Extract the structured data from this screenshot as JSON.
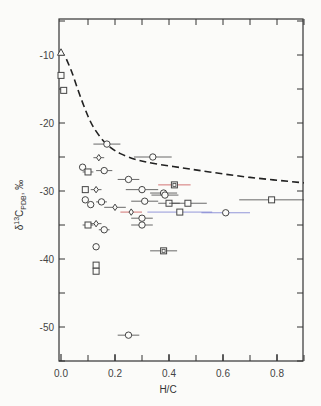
{
  "chart_data": {
    "type": "scatter",
    "title": "",
    "xlabel": "H/C",
    "ylabel": "δ13C PDB, ‰",
    "ylabel_parts": {
      "delta": "δ",
      "sup": "13",
      "main": "C",
      "sub": "PDB",
      "unit": ", ‰"
    },
    "xlim": [
      0.0,
      0.9
    ],
    "ylim": [
      -55,
      -5
    ],
    "xticks": [
      0.0,
      0.2,
      0.4,
      0.6,
      0.8
    ],
    "xtick_labels": [
      "0.0",
      "0.2",
      "0.4",
      "0.6",
      "0.8"
    ],
    "yticks": [
      -10,
      -20,
      -30,
      -40,
      -50
    ],
    "ytick_labels": [
      "-10",
      "-20",
      "-30",
      "-40",
      "-50"
    ],
    "grid": false,
    "legend": null,
    "curve": {
      "name": "dashed trend",
      "style": "dashed",
      "x": [
        0.02,
        0.04,
        0.06,
        0.08,
        0.1,
        0.12,
        0.15,
        0.18,
        0.22,
        0.28,
        0.35,
        0.45,
        0.55,
        0.7,
        0.9
      ],
      "y": [
        -10.6,
        -12.5,
        -14.8,
        -17.0,
        -19.0,
        -20.6,
        -22.3,
        -23.5,
        -24.5,
        -25.4,
        -26.0,
        -26.6,
        -27.2,
        -28.0,
        -28.8
      ]
    },
    "series": [
      {
        "name": "circles",
        "marker": "circle",
        "points": [
          {
            "x": 0.17,
            "y": -23.1,
            "xerr": 0.05
          },
          {
            "x": 0.34,
            "y": -25.0,
            "xerr": 0.07
          },
          {
            "x": 0.08,
            "y": -26.5,
            "xerr": 0.0
          },
          {
            "x": 0.16,
            "y": -27.0,
            "xerr": 0.03
          },
          {
            "x": 0.3,
            "y": -29.8,
            "xerr": 0.06
          },
          {
            "x": 0.38,
            "y": -30.3,
            "xerr": 0.05
          },
          {
            "x": 0.385,
            "y": -30.6,
            "xerr": 0.05
          },
          {
            "x": 0.09,
            "y": -31.3,
            "xerr": 0.0
          },
          {
            "x": 0.11,
            "y": -32.0,
            "xerr": 0.0
          },
          {
            "x": 0.15,
            "y": -31.6,
            "xerr": 0.02
          },
          {
            "x": 0.31,
            "y": -31.5,
            "xerr": 0.05
          },
          {
            "x": 0.61,
            "y": -33.2,
            "xerr": 0.09,
            "color": "#7a7fd0"
          },
          {
            "x": 0.16,
            "y": -35.7,
            "xerr": 0.02
          },
          {
            "x": 0.3,
            "y": -34.0,
            "xerr": 0.04
          },
          {
            "x": 0.3,
            "y": -35.0,
            "xerr": 0.04
          },
          {
            "x": 0.13,
            "y": -38.2,
            "xerr": 0.01
          },
          {
            "x": 0.25,
            "y": -51.2,
            "xerr": 0.04
          },
          {
            "x": 0.25,
            "y": -28.3,
            "xerr": 0.04
          }
        ]
      },
      {
        "name": "squares",
        "marker": "square",
        "points": [
          {
            "x": 0.0,
            "y": -13.0,
            "xerr": 0.0
          },
          {
            "x": 0.01,
            "y": -15.2,
            "xerr": 0.0
          },
          {
            "x": 0.1,
            "y": -27.2,
            "xerr": 0.02
          },
          {
            "x": 0.09,
            "y": -29.8,
            "xerr": 0.0
          },
          {
            "x": 0.4,
            "y": -31.8,
            "xerr": 0.04
          },
          {
            "x": 0.47,
            "y": -31.8,
            "xerr": 0.07
          },
          {
            "x": 0.78,
            "y": -31.3,
            "xerr": 0.12
          },
          {
            "x": 0.44,
            "y": -33.1,
            "xerr": 0.12,
            "color": "#7a7fd0"
          },
          {
            "x": 0.1,
            "y": -35.0,
            "xerr": 0.02
          },
          {
            "x": 0.13,
            "y": -40.9,
            "xerr": 0.01
          },
          {
            "x": 0.13,
            "y": -41.8,
            "xerr": 0.01
          }
        ]
      },
      {
        "name": "boxed squares",
        "marker": "boxed-square",
        "points": [
          {
            "x": 0.42,
            "y": -29.1,
            "xerr": 0.06,
            "color": "#c85050"
          },
          {
            "x": 0.38,
            "y": -38.8,
            "xerr": 0.05
          }
        ]
      },
      {
        "name": "diamonds",
        "marker": "diamond",
        "points": [
          {
            "x": 0.14,
            "y": -25.1,
            "xerr": 0.02
          },
          {
            "x": 0.13,
            "y": -29.8,
            "xerr": 0.02
          },
          {
            "x": 0.2,
            "y": -32.4,
            "xerr": 0.04
          },
          {
            "x": 0.26,
            "y": -33.1,
            "xerr": 0.04,
            "color": "#c85050"
          },
          {
            "x": 0.13,
            "y": -34.8,
            "xerr": 0.02
          }
        ]
      },
      {
        "name": "triangles",
        "marker": "triangle",
        "points": [
          {
            "x": 0.0,
            "y": -9.6,
            "xerr": 0.0
          }
        ]
      }
    ]
  },
  "layout": {
    "axis_color": "#333333",
    "marker_color": "#444444",
    "curve_color": "#222222"
  }
}
